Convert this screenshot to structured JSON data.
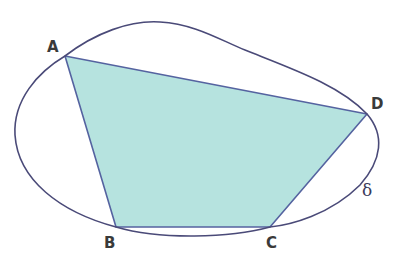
{
  "diagram": {
    "colors": {
      "curve": "#4a4a78",
      "polygon_stroke": "#5563a0",
      "polygon_fill": "#b6e3df",
      "label": "#3a3a3a"
    },
    "vertices": [
      {
        "name": "A",
        "label": "A"
      },
      {
        "name": "B",
        "label": "B"
      },
      {
        "name": "C",
        "label": "C"
      },
      {
        "name": "D",
        "label": "D"
      }
    ],
    "curve_label": "δ"
  }
}
